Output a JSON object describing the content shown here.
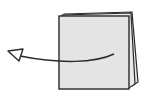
{
  "diagram": {
    "colors": {
      "stroke": "#2a2a2a",
      "page_fill": "#e6e6e6",
      "background": "#ffffff"
    },
    "elements": [
      {
        "name": "page-stack",
        "pages": 3
      },
      {
        "name": "curved-arrow",
        "direction": "left"
      }
    ]
  }
}
